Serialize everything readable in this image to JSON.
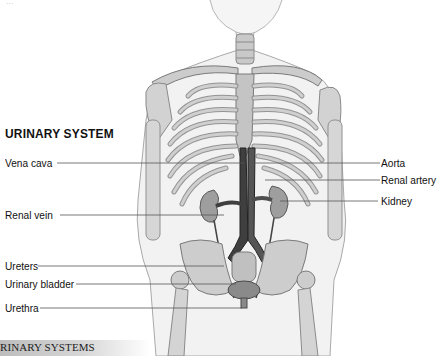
{
  "diagram": {
    "title": "URINARY SYSTEM",
    "top_faint_text": "...",
    "caption": "RINARY SYSTEMS",
    "labels_left": [
      {
        "id": "vena-cava",
        "text": "Vena cava"
      },
      {
        "id": "renal-vein",
        "text": "Renal vein"
      },
      {
        "id": "ureters",
        "text": "Ureters"
      },
      {
        "id": "urinary-bladder",
        "text": "Urinary bladder"
      },
      {
        "id": "urethra",
        "text": "Urethra"
      }
    ],
    "labels_right": [
      {
        "id": "aorta",
        "text": "Aorta"
      },
      {
        "id": "renal-artery",
        "text": "Renal artery"
      },
      {
        "id": "kidney",
        "text": "Kidney"
      }
    ],
    "colors": {
      "bone": "#c9c9c9",
      "bone_outline": "#7a7a7a",
      "skin": "#eeeeee",
      "skin_outline": "#9a9a9a",
      "vessel": "#4a4a4a",
      "leader_line": "#555555",
      "caption_bar": "#c4c4c4"
    }
  }
}
